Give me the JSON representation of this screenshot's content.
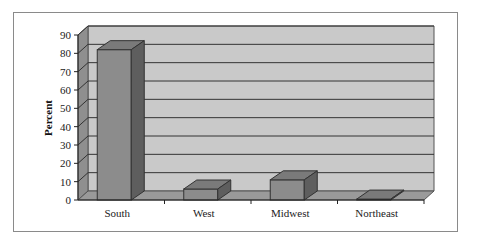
{
  "chart_data": {
    "type": "bar",
    "style": "3d-column",
    "title": "",
    "xlabel": "",
    "ylabel": "Percent",
    "ylim": [
      0,
      90
    ],
    "yticks": [
      0,
      10,
      20,
      30,
      40,
      50,
      60,
      70,
      80,
      90
    ],
    "categories": [
      "South",
      "West",
      "Midwest",
      "Northeast"
    ],
    "values": [
      82,
      6,
      11,
      0.5
    ],
    "grid": true,
    "legend": null,
    "colors": {
      "bar_front": "#8c8c8c",
      "bar_top": "#7a7a7a",
      "bar_side": "#5e5e5e",
      "wall": "#c9c9c9",
      "side_wall": "#8f8f8f",
      "floor": "#9a9a9a",
      "gridline": "#333333"
    }
  }
}
